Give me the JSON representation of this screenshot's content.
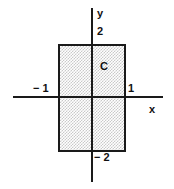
{
  "figure": {
    "title": "",
    "region_label": "C",
    "axis_labels": {
      "x": "x",
      "y": "y"
    },
    "tick_labels": {
      "y_top": "2",
      "y_bottom": "− 2",
      "x_left": "− 1",
      "x_right": "1"
    },
    "colors": {
      "stroke": "#1a1a1a",
      "fill": "#c9c9c9",
      "background": "#ffffff",
      "text": "#111111"
    }
  },
  "chart_data": {
    "type": "scatter",
    "title": "",
    "xlabel": "x",
    "ylabel": "y",
    "xlim": [
      -1.55,
      1.5
    ],
    "ylim": [
      -2.45,
      2.45
    ],
    "grid": false,
    "legend": null,
    "annotations": [
      {
        "text": "C",
        "x": 0.3,
        "y": 1.15,
        "description": "label identifying the shaded rectangular region"
      }
    ],
    "xticks": [
      -1,
      1
    ],
    "xticklabels": [
      "− 1",
      "1"
    ],
    "yticks": [
      -2,
      2
    ],
    "yticklabels": [
      "− 2",
      "2"
    ],
    "shapes": [
      {
        "kind": "rectangle",
        "name": "C",
        "x_min": -1,
        "x_max": 1,
        "y_min": -2,
        "y_max": 2,
        "width": 2,
        "height": 4,
        "filled": true,
        "fill_style": "stipple",
        "fill_color": "#c9c9c9",
        "edge_color": "#1a1a1a"
      }
    ]
  }
}
